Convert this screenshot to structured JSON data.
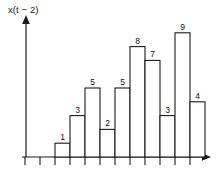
{
  "figure": {
    "y_axis_label": "x(t − 2)",
    "x_axis_label": "t"
  },
  "chart_data": {
    "type": "bar",
    "title": "",
    "subtitle": "",
    "xlabel": "t",
    "ylabel": "x(t − 2)",
    "categories": [
      "1",
      "2",
      "3",
      "4",
      "5",
      "6",
      "7",
      "8",
      "9",
      "10"
    ],
    "values": [
      1,
      3,
      5,
      2,
      5,
      8,
      7,
      3,
      9,
      4
    ],
    "data_labels": [
      "1",
      "3",
      "5",
      "2",
      "5",
      "8",
      "7",
      "3",
      "9",
      "4"
    ],
    "ylim": [
      0,
      10
    ],
    "xlim": [
      0,
      12
    ],
    "grid": false,
    "legend": null,
    "bar_fill": "#ffffff",
    "bar_stroke": "#1a1a1a",
    "axis_color": "#1a1a1a",
    "tick_marks_below_axis": true,
    "bar_count": 10,
    "first_bar_index": 2
  }
}
